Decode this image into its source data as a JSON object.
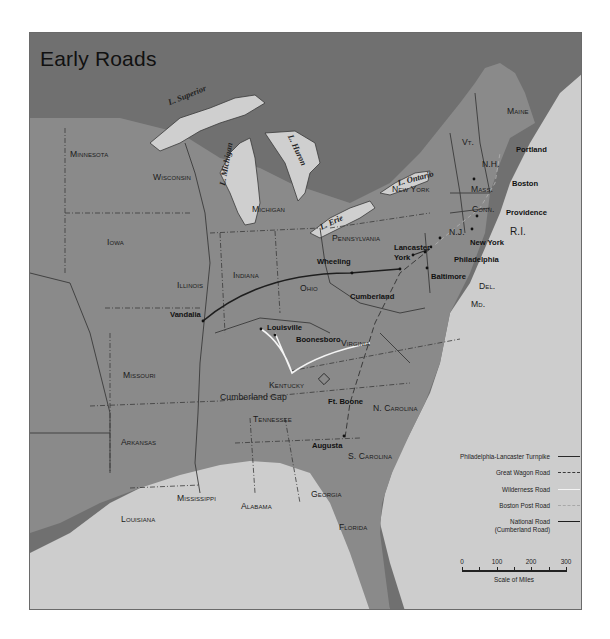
{
  "title": "Early Roads",
  "colors": {
    "canada_dark": "#6f6f6f",
    "land_us": "#8c8c8c",
    "water": "#cfcfcf",
    "border": "#3a3a3a",
    "philadelphia_lancaster_turnpike": "#2a2a2a",
    "great_wagon_road": "#3a3a3a",
    "wilderness_road": "#f4f4f4",
    "boston_post_road": "#a8a8a8",
    "national_road": "#1e1e1e"
  },
  "states": [
    {
      "name": "Minnesota"
    },
    {
      "name": "Wisconsin"
    },
    {
      "name": "Michigan"
    },
    {
      "name": "Iowa"
    },
    {
      "name": "Illinois"
    },
    {
      "name": "Indiana"
    },
    {
      "name": "Ohio"
    },
    {
      "name": "Missouri"
    },
    {
      "name": "Kentucky"
    },
    {
      "name": "Tennessee"
    },
    {
      "name": "Arkansas"
    },
    {
      "name": "Louisiana"
    },
    {
      "name": "Mississippi"
    },
    {
      "name": "Alabama"
    },
    {
      "name": "Georgia"
    },
    {
      "name": "Florida"
    },
    {
      "name": "S. Carolina"
    },
    {
      "name": "N. Carolina"
    },
    {
      "name": "Virginia"
    },
    {
      "name": "Pennsylvania"
    },
    {
      "name": "New York"
    },
    {
      "name": "Vt."
    },
    {
      "name": "N.H."
    },
    {
      "name": "Maine"
    },
    {
      "name": "Mass."
    },
    {
      "name": "Conn."
    },
    {
      "name": "R.I."
    },
    {
      "name": "N.J."
    },
    {
      "name": "Del."
    },
    {
      "name": "Md."
    }
  ],
  "lakes": [
    {
      "name": "L. Superior"
    },
    {
      "name": "L. Michigan"
    },
    {
      "name": "L. Huron"
    },
    {
      "name": "L. Erie"
    },
    {
      "name": "L. Ontario"
    }
  ],
  "cities": [
    {
      "name": "Portland"
    },
    {
      "name": "Boston"
    },
    {
      "name": "Providence"
    },
    {
      "name": "New York"
    },
    {
      "name": "Philadelphia"
    },
    {
      "name": "Lancaster"
    },
    {
      "name": "York"
    },
    {
      "name": "Baltimore"
    },
    {
      "name": "Wheeling"
    },
    {
      "name": "Cumberland"
    },
    {
      "name": "Vandalia"
    },
    {
      "name": "Louisville"
    },
    {
      "name": "Boonesboro"
    },
    {
      "name": "Cumberland Gap"
    },
    {
      "name": "Ft. Boone"
    },
    {
      "name": "Augusta"
    }
  ],
  "legend": {
    "items": [
      {
        "label": "Philadelphia-Lancaster Turnpike",
        "style": "solid"
      },
      {
        "label": "Great Wagon Road",
        "style": "dashed"
      },
      {
        "label": "Wilderness Road",
        "style": "solid-white"
      },
      {
        "label": "Boston Post Road",
        "style": "dashed-light"
      },
      {
        "label": "National Road",
        "label2": "(Cumberland Road)",
        "style": "solid-thick"
      }
    ]
  },
  "scale": {
    "ticks": [
      "0",
      "100",
      "200",
      "300"
    ],
    "caption": "Scale of Miles"
  }
}
